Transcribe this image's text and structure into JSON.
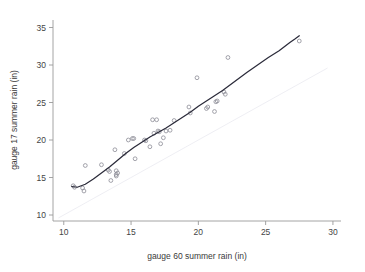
{
  "chart_data": {
    "type": "scatter",
    "title": "",
    "xlabel": "gauge 60 summer rain (in)",
    "ylabel": "gauge 17 summer rain (in)",
    "xlim": [
      9.2,
      30.6
    ],
    "ylim": [
      9.2,
      36.0
    ],
    "xticks": [
      10,
      15,
      20,
      25,
      30
    ],
    "yticks": [
      10,
      15,
      20,
      25,
      30,
      35
    ],
    "xtick_labels": [
      "10",
      "15",
      "20",
      "25",
      "30"
    ],
    "ytick_labels": [
      "10",
      "15",
      "20",
      "25",
      "30",
      "35"
    ],
    "grid": false,
    "legend": "none",
    "marker_style": "open-circle",
    "points": [
      [
        10.7,
        13.9
      ],
      [
        10.8,
        13.7
      ],
      [
        11.4,
        13.6
      ],
      [
        11.5,
        13.2
      ],
      [
        11.6,
        16.6
      ],
      [
        12.8,
        16.7
      ],
      [
        13.3,
        16.0
      ],
      [
        13.4,
        15.8
      ],
      [
        13.5,
        14.6
      ],
      [
        13.8,
        18.7
      ],
      [
        13.9,
        15.9
      ],
      [
        13.9,
        15.4
      ],
      [
        13.9,
        15.2
      ],
      [
        14.0,
        15.6
      ],
      [
        14.5,
        18.2
      ],
      [
        14.8,
        20.0
      ],
      [
        15.1,
        20.2
      ],
      [
        15.2,
        20.2
      ],
      [
        15.3,
        17.5
      ],
      [
        16.0,
        20.0
      ],
      [
        16.1,
        19.9
      ],
      [
        16.4,
        19.1
      ],
      [
        16.6,
        22.7
      ],
      [
        16.9,
        22.7
      ],
      [
        16.7,
        20.9
      ],
      [
        17.0,
        21.2
      ],
      [
        17.1,
        21.1
      ],
      [
        17.2,
        19.5
      ],
      [
        17.4,
        20.3
      ],
      [
        17.6,
        21.2
      ],
      [
        17.9,
        21.3
      ],
      [
        18.2,
        22.6
      ],
      [
        19.3,
        24.4
      ],
      [
        19.4,
        23.6
      ],
      [
        19.9,
        28.3
      ],
      [
        20.6,
        24.2
      ],
      [
        20.7,
        24.4
      ],
      [
        21.2,
        23.8
      ],
      [
        21.3,
        25.1
      ],
      [
        21.4,
        25.2
      ],
      [
        21.9,
        26.4
      ],
      [
        22.0,
        26.1
      ],
      [
        22.2,
        31.0
      ],
      [
        27.5,
        33.2
      ]
    ],
    "fit_curve": {
      "name": "lowess smoothed fit",
      "points": [
        [
          10.6,
          13.8
        ],
        [
          11.0,
          13.7
        ],
        [
          11.6,
          14.1
        ],
        [
          12.2,
          14.8
        ],
        [
          12.8,
          15.6
        ],
        [
          13.4,
          16.4
        ],
        [
          14.0,
          17.3
        ],
        [
          14.6,
          18.2
        ],
        [
          15.2,
          19.0
        ],
        [
          15.8,
          19.7
        ],
        [
          16.4,
          20.4
        ],
        [
          17.0,
          21.0
        ],
        [
          17.6,
          21.6
        ],
        [
          18.2,
          22.3
        ],
        [
          18.8,
          23.0
        ],
        [
          19.4,
          23.7
        ],
        [
          20.0,
          24.5
        ],
        [
          20.6,
          25.2
        ],
        [
          21.2,
          25.9
        ],
        [
          21.8,
          26.6
        ],
        [
          22.4,
          27.4
        ],
        [
          23.0,
          28.2
        ],
        [
          23.6,
          29.0
        ],
        [
          24.4,
          30.0
        ],
        [
          25.2,
          31.0
        ],
        [
          26.0,
          31.9
        ],
        [
          26.8,
          33.0
        ],
        [
          27.2,
          33.5
        ],
        [
          27.5,
          33.9
        ]
      ]
    },
    "reference_line": {
      "name": "identity line",
      "points": [
        [
          9.6,
          9.6
        ],
        [
          29.6,
          29.6
        ]
      ]
    }
  }
}
